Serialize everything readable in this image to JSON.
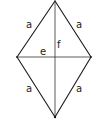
{
  "diagram": {
    "colors": {
      "line": "#1a1a1a",
      "text": "#222222",
      "background": "#ffffff"
    },
    "vertices": {
      "top": [
        55,
        1
      ],
      "left": [
        17,
        57
      ],
      "right": [
        91,
        57
      ],
      "bottom": [
        55,
        117
      ]
    },
    "sides": [
      {
        "name": "top-left",
        "label": "a"
      },
      {
        "name": "top-right",
        "label": "a"
      },
      {
        "name": "bottom-left",
        "label": "a"
      },
      {
        "name": "bottom-right",
        "label": "a"
      }
    ],
    "diagonals": {
      "horizontal": {
        "label": "e"
      },
      "vertical": {
        "label": "f"
      }
    }
  }
}
